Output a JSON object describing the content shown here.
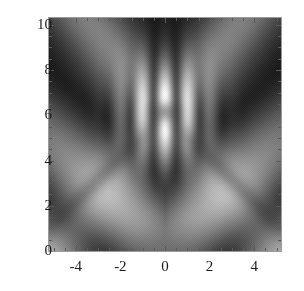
{
  "figure": {
    "title": "",
    "background_color": "#ffffff",
    "frame_color": "#9a9a9a",
    "tick_color": "#5a5a5a",
    "label_color": "#1a1a1a"
  },
  "chart_data": {
    "type": "heatmap",
    "title": "",
    "xlabel": "",
    "ylabel": "",
    "colormap": "grayscale",
    "colormap_low": "#000000",
    "colormap_high": "#ffffff",
    "grid": false,
    "legend": "none",
    "xlim": [
      -5.2,
      5.2
    ],
    "ylim": [
      0,
      10.3
    ],
    "xticks": [
      -4,
      -2,
      0,
      2,
      4
    ],
    "xtick_labels": [
      "-4",
      "-2",
      "0",
      "2",
      "4"
    ],
    "yticks": [
      0,
      2,
      4,
      6,
      8,
      10
    ],
    "ytick_labels": [
      "0",
      "2",
      "4",
      "6",
      "8",
      "10"
    ],
    "xminor_step": 0.5,
    "yminor_step": 0.5,
    "value_range": [
      0,
      1
    ],
    "features": [
      {
        "name": "central-dark-node",
        "x": 0.0,
        "y": 6.1,
        "value": 0.05
      },
      {
        "name": "bright-node-column",
        "x": 0.0,
        "y": 7.1,
        "value": 0.95
      },
      {
        "name": "dark-lobe-left",
        "x": -1.0,
        "y": 7.0,
        "value": 0.08
      },
      {
        "name": "dark-lobe-right",
        "x": 1.0,
        "y": 7.0,
        "value": 0.08
      },
      {
        "name": "light-rhombus-centre",
        "x": 0.0,
        "y": 3.2,
        "value": 0.62
      },
      {
        "name": "dark-vertex-left",
        "x": -3.0,
        "y": 3.0,
        "value": 0.12
      },
      {
        "name": "dark-vertex-right",
        "x": 3.0,
        "y": 3.0,
        "value": 0.12
      },
      {
        "name": "dark-basin-bottom",
        "x": 0.0,
        "y": 0.2,
        "value": 0.18
      }
    ],
    "axes": {
      "x": {
        "min": -5.2,
        "max": 5.2
      },
      "y": {
        "min": 0.0,
        "max": 10.3
      }
    }
  },
  "axis": {
    "y_labels": [
      {
        "text": "10",
        "value": 10
      },
      {
        "text": "8",
        "value": 8
      },
      {
        "text": "6",
        "value": 6
      },
      {
        "text": "4",
        "value": 4
      },
      {
        "text": "2",
        "value": 2
      },
      {
        "text": "0",
        "value": 0
      }
    ],
    "x_labels": [
      {
        "text": "-4",
        "value": -4
      },
      {
        "text": "-2",
        "value": -2
      },
      {
        "text": "0",
        "value": 0
      },
      {
        "text": "2",
        "value": 2
      },
      {
        "text": "4",
        "value": 4
      }
    ]
  }
}
